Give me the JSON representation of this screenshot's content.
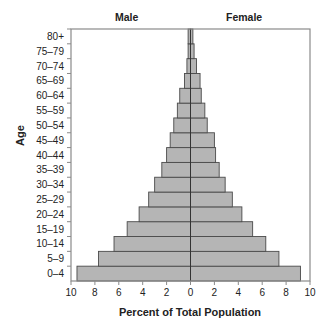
{
  "chart_data": {
    "type": "bar",
    "orientation": "horizontal",
    "subtype": "population-pyramid",
    "title": "",
    "headers": {
      "left": "Male",
      "right": "Female"
    },
    "xlabel": "Percent of Total Population",
    "ylabel": "Age",
    "xlim": [
      -10,
      10
    ],
    "xticks": [
      10,
      8,
      6,
      4,
      2,
      0,
      2,
      4,
      6,
      8,
      10
    ],
    "grid": false,
    "legend": "none",
    "categories": [
      "0–4",
      "5–9",
      "10–14",
      "15–19",
      "20–24",
      "25–29",
      "30–34",
      "35–39",
      "40–44",
      "45–49",
      "50–54",
      "55–59",
      "60–64",
      "65–69",
      "70–74",
      "75–79",
      "80+"
    ],
    "series": [
      {
        "name": "Male",
        "values": [
          9.5,
          7.7,
          6.4,
          5.3,
          4.3,
          3.5,
          3.0,
          2.4,
          2.0,
          1.7,
          1.4,
          1.1,
          0.9,
          0.5,
          0.3,
          0.2,
          0.2
        ]
      },
      {
        "name": "Female",
        "values": [
          9.2,
          7.4,
          6.3,
          5.2,
          4.3,
          3.5,
          2.9,
          2.4,
          2.1,
          2.0,
          1.4,
          1.2,
          0.9,
          0.8,
          0.5,
          0.3,
          0.2
        ]
      }
    ],
    "colors": {
      "bar_fill": "#b5b5b5",
      "bar_edge": "#4a4a4a",
      "frame": "#8a8a8a",
      "text": "#222222"
    }
  }
}
